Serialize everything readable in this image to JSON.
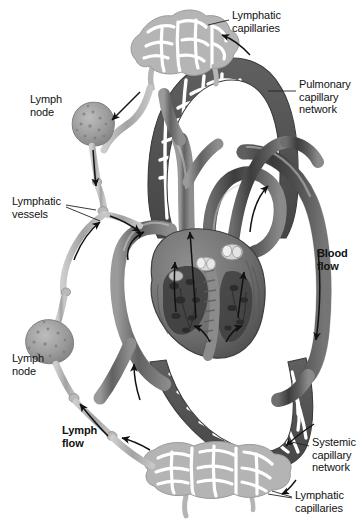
{
  "labels": {
    "lymphatic_capillaries_top": "Lymphatic\ncapillaries",
    "pulmonary_capillary_network": "Pulmonary\ncapillary\nnetwork",
    "lymph_node_upper": "Lymph\nnode",
    "lymphatic_vessels": "Lymphatic\nvessels",
    "blood_flow": "Blood\nflow",
    "lymph_node_lower": "Lymph\nnode",
    "lymph_flow": "Lymph\nflow",
    "systemic_capillary_network": "Systemic\ncapillary\nnetwork",
    "lymphatic_capillaries_bottom": "Lymphatic\ncapillaries"
  },
  "colors": {
    "background": "#ffffff",
    "text": "#111111",
    "leader_line": "#222222",
    "arrow": "#111111",
    "blood_vessel_dark": "#4a4a4a",
    "blood_vessel_mid": "#6f6f6f",
    "blood_vessel_light": "#9b9b9b",
    "capillary_network_dark": "#5c5c5c",
    "lymphatic_vessel": "#a9a9a9",
    "lymphatic_capillary": "#b0b0b0",
    "lymph_node_fill": "#9a9a9a",
    "heart_muscle": "#777777",
    "heart_chamber_dark": "#3f3f3f",
    "valve_light": "#d8d8d8"
  },
  "structures": [
    {
      "name": "lymphatic-capillaries-top",
      "kind": "mesh",
      "tone": "light"
    },
    {
      "name": "pulmonary-capillary-network",
      "kind": "mesh-arch",
      "tone": "dark"
    },
    {
      "name": "lymph-node-upper",
      "kind": "node"
    },
    {
      "name": "lymphatic-vessel-chain-left",
      "kind": "vessel",
      "tone": "light"
    },
    {
      "name": "lymph-node-lower",
      "kind": "node"
    },
    {
      "name": "heart",
      "kind": "organ-cutaway"
    },
    {
      "name": "aorta-arch",
      "kind": "vessel",
      "tone": "dark"
    },
    {
      "name": "pulmonary-trunk",
      "kind": "vessel",
      "tone": "mid"
    },
    {
      "name": "venae-cavae",
      "kind": "vessel",
      "tone": "mid"
    },
    {
      "name": "systemic-capillary-network",
      "kind": "mesh-arch",
      "tone": "dark"
    },
    {
      "name": "lymphatic-capillaries-bottom",
      "kind": "mesh",
      "tone": "light"
    }
  ],
  "flow_arrows": [
    {
      "name": "lymph-flow-arrow-upper-left",
      "direction": "down"
    },
    {
      "name": "lymph-flow-arrow-junction",
      "direction": "right-down"
    },
    {
      "name": "lymph-flow-arrow-lower-left",
      "direction": "up"
    },
    {
      "name": "lymph-flow-arrow-bottom",
      "direction": "up-left"
    },
    {
      "name": "blood-flow-arrow-aorta",
      "direction": "down"
    },
    {
      "name": "blood-flow-arrow-pulmonary",
      "direction": "up"
    },
    {
      "name": "blood-flow-arrow-vena-cava",
      "direction": "up"
    },
    {
      "name": "blood-flow-arrow-left-ventricle",
      "direction": "up"
    },
    {
      "name": "blood-flow-arrow-right-ventricle",
      "direction": "up"
    }
  ]
}
